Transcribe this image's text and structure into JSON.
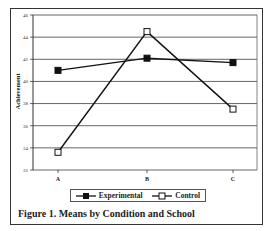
{
  "chart_data": {
    "type": "line",
    "title": "Figure 1. Means by Condition and School",
    "xlabel": "",
    "ylabel": "Achievement",
    "categories": [
      "A",
      "B",
      "C"
    ],
    "series": [
      {
        "name": "Experimental",
        "marker": "filled-square",
        "values": [
          41.0,
          42.1,
          41.7
        ]
      },
      {
        "name": "Control",
        "marker": "open-square",
        "values": [
          33.6,
          44.5,
          37.5
        ]
      }
    ],
    "yticks": [
      32,
      34,
      36,
      38,
      40,
      42,
      44,
      46
    ],
    "ylim": [
      32,
      46
    ],
    "grid": true,
    "legend_position": "bottom"
  },
  "legend": {
    "experimental": "Experimental",
    "control": "Control"
  },
  "caption": "Figure 1. Means by Condition and School",
  "ylabel": "Achievement"
}
